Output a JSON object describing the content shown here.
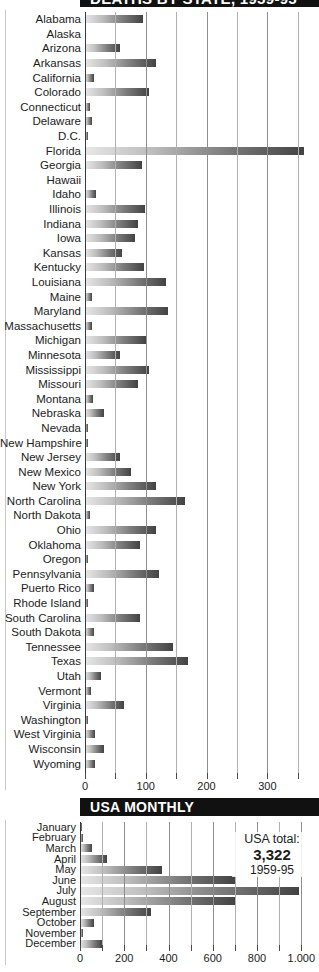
{
  "sections": {
    "states": {
      "title": "DEATHS BY STATE, 1959-95"
    },
    "monthly": {
      "title": "USA MONTHLY"
    }
  },
  "total_callout": {
    "label": "USA total:",
    "value": "3,322",
    "period": "1959-95"
  },
  "chart_data": [
    {
      "type": "bar",
      "orientation": "horizontal",
      "title": "DEATHS BY STATE, 1959-95",
      "xlabel": "",
      "ylabel": "",
      "xlim": [
        0,
        385
      ],
      "grid": true,
      "gridlines": [
        0,
        50,
        100,
        150,
        200,
        250,
        300,
        350
      ],
      "ticks": [
        {
          "value": 0,
          "label": "0"
        },
        {
          "value": 50,
          "label": ""
        },
        {
          "value": 100,
          "label": "100"
        },
        {
          "value": 150,
          "label": ""
        },
        {
          "value": 200,
          "label": "200"
        },
        {
          "value": 250,
          "label": ""
        },
        {
          "value": 300,
          "label": "300"
        },
        {
          "value": 350,
          "label": ""
        }
      ],
      "categories": [
        "Alabama",
        "Alaska",
        "Arizona",
        "Arkansas",
        "California",
        "Colorado",
        "Connecticut",
        "Delaware",
        "D.C.",
        "Florida",
        "Georgia",
        "Hawaii",
        "Idaho",
        "Illinois",
        "Indiana",
        "Iowa",
        "Kansas",
        "Kentucky",
        "Louisiana",
        "Maine",
        "Maryland",
        "Massachusetts",
        "Michigan",
        "Minnesota",
        "Mississippi",
        "Missouri",
        "Montana",
        "Nebraska",
        "Nevada",
        "New Hampshire",
        "New Jersey",
        "New Mexico",
        "New York",
        "North Carolina",
        "North Dakota",
        "Ohio",
        "Oklahoma",
        "Oregon",
        "Pennsylvania",
        "Puerto Rico",
        "Rhode Island",
        "South Carolina",
        "South Dakota",
        "Tennessee",
        "Texas",
        "Utah",
        "Vermont",
        "Virginia",
        "Washington",
        "West Virginia",
        "Wisconsin",
        "Wyoming"
      ],
      "values": [
        96,
        0,
        58,
        117,
        14,
        105,
        9,
        11,
        4,
        360,
        93,
        0,
        18,
        98,
        88,
        82,
        61,
        97,
        133,
        12,
        137,
        12,
        101,
        58,
        105,
        87,
        13,
        32,
        5,
        5,
        58,
        76,
        116,
        165,
        9,
        117,
        90,
        5,
        121,
        15,
        3,
        90,
        14,
        145,
        170,
        26,
        10,
        64,
        3,
        17,
        32,
        16
      ]
    },
    {
      "type": "bar",
      "orientation": "horizontal",
      "title": "USA MONTHLY",
      "xlabel": "",
      "ylabel": "",
      "xlim": [
        0,
        1080
      ],
      "grid": true,
      "gridlines": [
        0,
        100,
        200,
        300,
        400,
        500,
        600,
        700,
        800,
        900,
        1000
      ],
      "ticks": [
        {
          "value": 0,
          "label": "0"
        },
        {
          "value": 100,
          "label": ""
        },
        {
          "value": 200,
          "label": "200"
        },
        {
          "value": 300,
          "label": ""
        },
        {
          "value": 400,
          "label": "400"
        },
        {
          "value": 500,
          "label": ""
        },
        {
          "value": 600,
          "label": "600"
        },
        {
          "value": 700,
          "label": ""
        },
        {
          "value": 800,
          "label": "800"
        },
        {
          "value": 900,
          "label": ""
        },
        {
          "value": 1000,
          "label": "1.000"
        }
      ],
      "categories": [
        "January",
        "February",
        "March",
        "April",
        "May",
        "June",
        "July",
        "August",
        "September",
        "October",
        "November",
        "December"
      ],
      "values": [
        8,
        12,
        55,
        120,
        370,
        700,
        990,
        700,
        320,
        65,
        14,
        100
      ]
    }
  ]
}
